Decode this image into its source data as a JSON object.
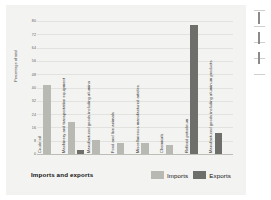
{
  "figure": {
    "title": "Imports and exports",
    "y_axis_title": "Percentage of total"
  },
  "legend": {
    "position": "bottom-right",
    "items": [
      {
        "label": "Imports",
        "color": "#b9b9b4",
        "key": "imports"
      },
      {
        "label": "Exports",
        "color": "#6e6e6a",
        "key": "exports"
      }
    ]
  },
  "chart_data": {
    "type": "bar",
    "title": "Imports and exports",
    "xlabel": "",
    "ylabel": "Percentage of total",
    "ylim": [
      0,
      80
    ],
    "yticks": [
      0,
      8,
      16,
      24,
      32,
      40,
      48,
      56,
      64,
      72,
      80
    ],
    "grid": true,
    "legend_position": "bottom-right",
    "categories": [
      "Crude oil",
      "Machinery and transportation equipment",
      "Manufactured goods including alumina",
      "Food and live animals",
      "Miscellaneous manufactured articles",
      "Chemicals",
      "Refined petroleum",
      "Manufactured goods including aluminum products"
    ],
    "series": [
      {
        "name": "Imports",
        "color": "#b9b9b4",
        "values": [
          42,
          20,
          9,
          7,
          7,
          6,
          null,
          null
        ]
      },
      {
        "name": "Exports",
        "color": "#6e6e6a",
        "values": [
          null,
          3,
          null,
          null,
          null,
          null,
          78,
          13
        ]
      }
    ]
  }
}
